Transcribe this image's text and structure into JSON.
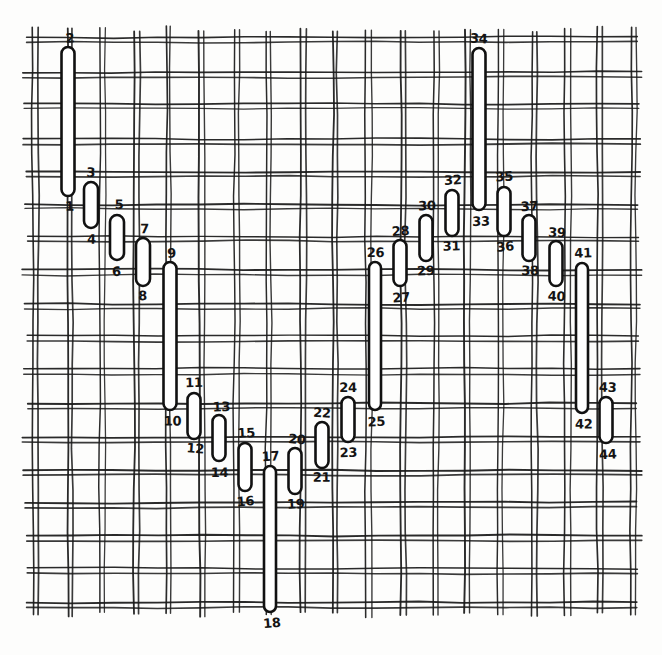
{
  "figure": {
    "background_color": "#fdfdfc",
    "line_color": "#1a1a1a",
    "marker_fill": "#ffffff",
    "marker_stroke": "#111111",
    "mesh": {
      "left": 34,
      "top": 38,
      "right": 630,
      "bottom": 606,
      "cell_pitch": 33.2,
      "pair_gap": 5.0,
      "line_width": 1.7,
      "columns": 18,
      "rows": 17
    },
    "markers": [
      {
        "id": 1,
        "top_label": "2",
        "bottom_label": "1",
        "cx": 68,
        "y1": 47,
        "y2": 196,
        "rx": 6.5
      },
      {
        "id": 2,
        "top_label": "3",
        "bottom_label": "4",
        "cx": 91,
        "y1": 182,
        "y2": 228,
        "rx": 7.0
      },
      {
        "id": 3,
        "top_label": "5",
        "bottom_label": "6",
        "cx": 117,
        "y1": 215,
        "y2": 260,
        "rx": 7.0
      },
      {
        "id": 4,
        "top_label": "7",
        "bottom_label": "8",
        "cx": 143,
        "y1": 238,
        "y2": 286,
        "rx": 7.0
      },
      {
        "id": 5,
        "top_label": "9",
        "bottom_label": "10",
        "cx": 170,
        "y1": 262,
        "y2": 410,
        "rx": 6.5
      },
      {
        "id": 6,
        "top_label": "11",
        "bottom_label": "12",
        "cx": 194,
        "y1": 393,
        "y2": 439,
        "rx": 6.5
      },
      {
        "id": 7,
        "top_label": "13",
        "bottom_label": "14",
        "cx": 219,
        "y1": 415,
        "y2": 461,
        "rx": 6.5
      },
      {
        "id": 8,
        "top_label": "15",
        "bottom_label": "16",
        "cx": 245,
        "y1": 443,
        "y2": 491,
        "rx": 6.5
      },
      {
        "id": 9,
        "top_label": "17",
        "bottom_label": "18",
        "cx": 270,
        "y1": 466,
        "y2": 612,
        "rx": 6.0
      },
      {
        "id": 10,
        "top_label": "20",
        "bottom_label": "19",
        "cx": 295,
        "y1": 448,
        "y2": 494,
        "rx": 6.5
      },
      {
        "id": 11,
        "top_label": "22",
        "bottom_label": "21",
        "cx": 322,
        "y1": 422,
        "y2": 468,
        "rx": 6.5
      },
      {
        "id": 12,
        "top_label": "24",
        "bottom_label": "23",
        "cx": 348,
        "y1": 397,
        "y2": 442,
        "rx": 6.5
      },
      {
        "id": 13,
        "top_label": "26",
        "bottom_label": "25",
        "cx": 375,
        "y1": 262,
        "y2": 410,
        "rx": 6.0
      },
      {
        "id": 14,
        "top_label": "28",
        "bottom_label": "27",
        "cx": 400,
        "y1": 240,
        "y2": 286,
        "rx": 6.5
      },
      {
        "id": 15,
        "top_label": "30",
        "bottom_label": "29",
        "cx": 426,
        "y1": 215,
        "y2": 261,
        "rx": 6.5
      },
      {
        "id": 16,
        "top_label": "32",
        "bottom_label": "31",
        "cx": 452,
        "y1": 190,
        "y2": 236,
        "rx": 6.5
      },
      {
        "id": 17,
        "top_label": "34",
        "bottom_label": "33",
        "cx": 479,
        "y1": 48,
        "y2": 210,
        "rx": 6.5
      },
      {
        "id": 18,
        "top_label": "35",
        "bottom_label": "36",
        "cx": 504,
        "y1": 187,
        "y2": 236,
        "rx": 6.5
      },
      {
        "id": 19,
        "top_label": "37",
        "bottom_label": "38",
        "cx": 529,
        "y1": 215,
        "y2": 261,
        "rx": 6.5
      },
      {
        "id": 20,
        "top_label": "39",
        "bottom_label": "40",
        "cx": 556,
        "y1": 241,
        "y2": 286,
        "rx": 6.5
      },
      {
        "id": 21,
        "top_label": "41",
        "bottom_label": "42",
        "cx": 582,
        "y1": 263,
        "y2": 413,
        "rx": 6.0
      },
      {
        "id": 22,
        "top_label": "43",
        "bottom_label": "44",
        "cx": 606,
        "y1": 397,
        "y2": 443,
        "rx": 6.5
      }
    ]
  }
}
